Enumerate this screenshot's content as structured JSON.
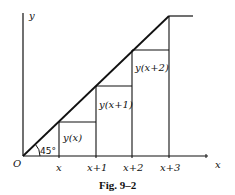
{
  "figure": {
    "caption": "Fig. 9–2",
    "axes": {
      "x_label": "x",
      "y_label": "y",
      "origin_label": "O"
    },
    "angle_label": "45°",
    "x_ticks": [
      "x",
      "x+1",
      "x+2",
      "x+3"
    ],
    "step_labels": [
      "y(x)",
      "y(x+1)",
      "y(x+2)"
    ],
    "colors": {
      "line": "#111111",
      "background": "#ffffff"
    }
  }
}
